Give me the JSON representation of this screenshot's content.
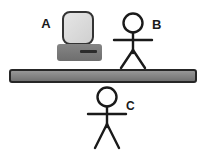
{
  "scene": {
    "width": 208,
    "height": 153,
    "background_color": "#ffffff",
    "description": "Physics style diagram: a computer on a table-like horizontal bar with two stick figures"
  },
  "colors": {
    "outline": "#222222",
    "stroke": "#1a1a1a",
    "screen_fill": "#dcdcdc",
    "screen_border": "#333333",
    "base_fill": "#787878",
    "base_slot": "#2b2b2b",
    "bar_fill_top": "#8f8f8f",
    "bar_fill_bottom": "#6f6f6f",
    "bar_border": "#262626",
    "label_color": "#1a1a1a"
  },
  "objects": {
    "computer": {
      "name": "computer",
      "label": "A",
      "label_x": 46,
      "label_y": 28,
      "screen": {
        "x": 63,
        "y": 12,
        "w": 30,
        "h": 32,
        "r": 7
      },
      "base": {
        "x": 57,
        "y": 44,
        "w": 45,
        "h": 17,
        "r": 3
      },
      "slot": {
        "x": 80,
        "y": 50,
        "w": 17,
        "h": 3
      }
    },
    "figure_b": {
      "name": "stick-figure-b",
      "label": "B",
      "label_x": 152,
      "label_y": 29,
      "head": {
        "cx": 133,
        "cy": 23,
        "r": 9.5
      },
      "body": {
        "x": 133,
        "y1": 32.5,
        "y2": 53
      },
      "arms": {
        "y": 40,
        "x1": 114,
        "x2": 152
      },
      "leg_left": {
        "x1": 133,
        "y1": 50,
        "x2": 121,
        "y2": 68
      },
      "leg_right": {
        "x1": 133,
        "y1": 50,
        "x2": 145,
        "y2": 68
      }
    },
    "figure_c": {
      "name": "stick-figure-c",
      "label": "C",
      "label_x": 126,
      "label_y": 110,
      "head": {
        "cx": 107,
        "cy": 97,
        "r": 9.5
      },
      "body": {
        "x": 107,
        "y1": 106.5,
        "y2": 127
      },
      "arms": {
        "y": 114,
        "x1": 88,
        "x2": 126
      },
      "leg_left": {
        "x1": 107,
        "y1": 124,
        "x2": 95,
        "y2": 148
      },
      "leg_right": {
        "x1": 107,
        "y1": 124,
        "x2": 119,
        "y2": 148
      }
    },
    "bar": {
      "name": "horizontal-bar",
      "x": 10,
      "y": 70,
      "w": 186,
      "h": 12,
      "r": 2
    }
  },
  "labels": {
    "a": "A",
    "b": "B",
    "c": "C"
  }
}
